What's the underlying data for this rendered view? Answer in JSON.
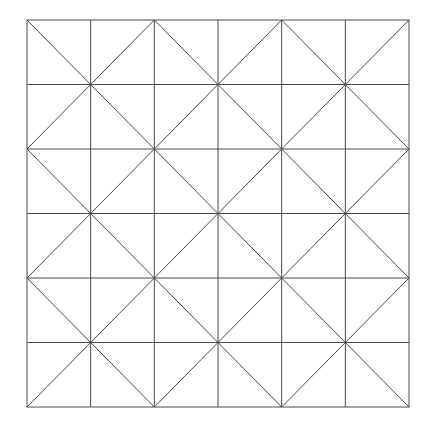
{
  "diagram": {
    "type": "grid-with-diagonals",
    "rows": 6,
    "cols": 6,
    "origin": {
      "x": 27,
      "y": 20
    },
    "extent": {
      "x": 409,
      "y": 407
    },
    "line_color": "#4a4a4a",
    "line_width": 1,
    "background": "#ffffff",
    "diagonals_main": [
      -4,
      -2,
      0,
      2,
      4
    ],
    "diagonals_anti": [
      2,
      4,
      6,
      8,
      10
    ]
  }
}
